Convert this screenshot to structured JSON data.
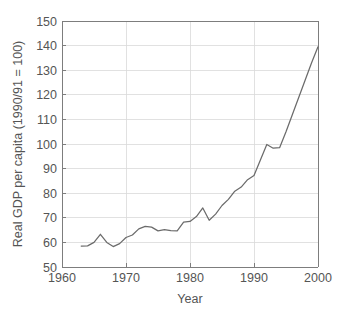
{
  "chart_data": {
    "type": "line",
    "title": "",
    "xlabel": "Year",
    "ylabel": "Real GDP per capita (1990/91 = 100)",
    "xlim": [
      1960,
      2000
    ],
    "ylim": [
      50,
      150
    ],
    "xticks": [
      1960,
      1970,
      1980,
      1990,
      2000
    ],
    "yticks": [
      50,
      60,
      70,
      80,
      90,
      100,
      110,
      120,
      130,
      140,
      150
    ],
    "grid": true,
    "legend": "none",
    "line_color": "#6b6b6b",
    "grid_color": "#d9d9d9",
    "axis_color": "#7d7d7d",
    "series": [
      {
        "name": "Real GDP per capita",
        "x": [
          1963,
          1964,
          1965,
          1966,
          1967,
          1968,
          1969,
          1970,
          1971,
          1972,
          1973,
          1974,
          1975,
          1976,
          1977,
          1978,
          1979,
          1980,
          1981,
          1982,
          1983,
          1984,
          1985,
          1986,
          1987,
          1988,
          1989,
          1990,
          1991,
          1992,
          1993,
          1994,
          1995,
          1996,
          1997,
          1998,
          1999
        ],
        "values": [
          58.5,
          58.6,
          60.0,
          63.3,
          60.0,
          58.3,
          59.5,
          62.0,
          63.0,
          65.5,
          66.5,
          66.2,
          64.7,
          65.2,
          64.8,
          64.7,
          68.2,
          68.5,
          70.5,
          74.0,
          69.0,
          71.5,
          75.0,
          77.5,
          80.8,
          82.5,
          85.5,
          87.2,
          93.5,
          99.8,
          98.3,
          98.5,
          105.0,
          112.0,
          119.0,
          126.0,
          133.0
        ],
        "end_x": 2000,
        "end_value": 139.5
      }
    ]
  },
  "axis_labels": {
    "y_title": "Real GDP per capita (1990/91 = 100)",
    "x_title": "Year"
  }
}
